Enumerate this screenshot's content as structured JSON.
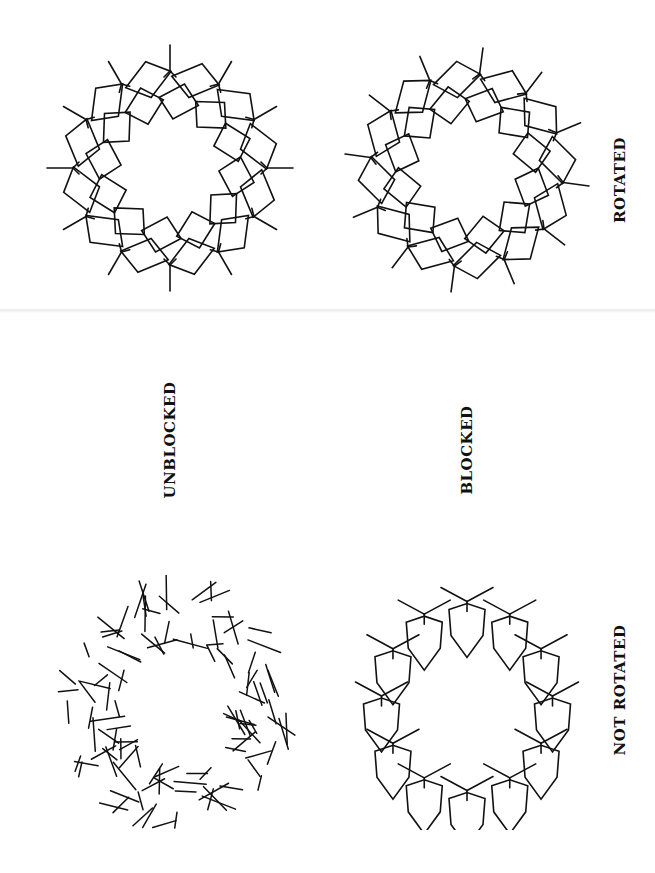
{
  "page": {
    "background": "#ffffff",
    "ink": "#111111"
  },
  "labels": {
    "unblocked": "UNBLOCKED",
    "blocked": "BLOCKED",
    "rotated": "ROTATED",
    "not_rotated": "NOT ROTATED"
  },
  "figures": [
    {
      "id": "unblocked-rotated",
      "style": "rotated-ring",
      "cx": 170,
      "cy": 168,
      "r": 95,
      "units": 12,
      "phase": 0.0
    },
    {
      "id": "blocked-rotated",
      "style": "rotated-ring",
      "cx": 467,
      "cy": 170,
      "r": 95,
      "units": 12,
      "phase": 0.13
    },
    {
      "id": "unblocked-not-rotated",
      "style": "scattered-sticks",
      "cx": 175,
      "cy": 705,
      "r": 105,
      "units": 14
    },
    {
      "id": "blocked-not-rotated",
      "style": "diamond-ring",
      "cx": 467,
      "cy": 700,
      "r": 90,
      "units": 12
    }
  ],
  "label_positions": {
    "unblocked": {
      "x": 170,
      "y": 440
    },
    "blocked": {
      "x": 467,
      "y": 450
    },
    "rotated": {
      "x": 620,
      "y": 180
    },
    "not_rotated": {
      "x": 620,
      "y": 690
    }
  }
}
